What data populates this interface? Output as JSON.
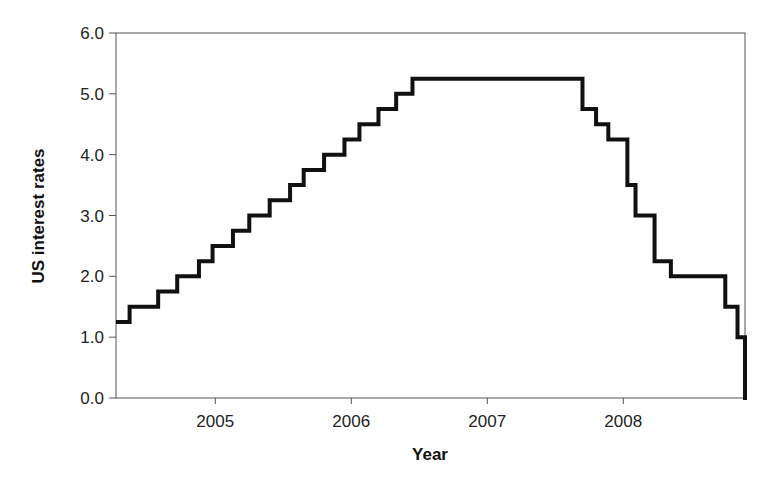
{
  "chart_data": {
    "type": "line",
    "subtype": "step",
    "title": "",
    "xlabel": "Year",
    "ylabel": "US interest rates",
    "ylim": [
      0.0,
      6.0
    ],
    "xlim": [
      2004.27,
      2008.9
    ],
    "yticks": [
      "0.0",
      "1.0",
      "2.0",
      "3.0",
      "4.0",
      "5.0",
      "6.0"
    ],
    "ytick_values": [
      0,
      1,
      2,
      3,
      4,
      5,
      6
    ],
    "xticks": [
      "2005",
      "2006",
      "2007",
      "2008"
    ],
    "xtick_values": [
      2005,
      2006,
      2007,
      2008
    ],
    "grid": false,
    "legend": null,
    "line_color": "#111111",
    "series": [
      {
        "name": "US interest rates",
        "x": [
          2004.27,
          2004.37,
          2004.58,
          2004.72,
          2004.88,
          2004.98,
          2005.13,
          2005.25,
          2005.4,
          2005.55,
          2005.65,
          2005.8,
          2005.95,
          2006.06,
          2006.2,
          2006.33,
          2006.45,
          2007.7,
          2007.8,
          2007.89,
          2008.03,
          2008.09,
          2008.23,
          2008.35,
          2008.75,
          2008.84,
          2008.97
        ],
        "values": [
          1.25,
          1.5,
          1.75,
          2.0,
          2.25,
          2.5,
          2.75,
          3.0,
          3.25,
          3.5,
          3.75,
          4.0,
          4.25,
          4.5,
          4.75,
          5.0,
          5.25,
          4.75,
          4.5,
          4.25,
          3.5,
          3.0,
          2.25,
          2.0,
          1.5,
          1.0,
          0.0
        ]
      }
    ]
  },
  "axes": {
    "x_title": "Year",
    "y_title": "US interest rates"
  }
}
